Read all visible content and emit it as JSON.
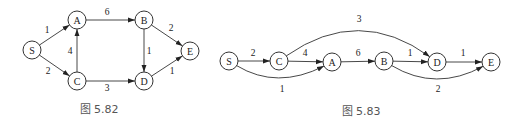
{
  "figures": [
    {
      "id": "fig1",
      "caption": "图 5.82",
      "caption_pos": [
        99,
        109
      ],
      "node_radius": 9,
      "nodes": [
        {
          "id": "S",
          "label": "S",
          "x": 32,
          "y": 50
        },
        {
          "id": "A",
          "label": "A",
          "x": 77,
          "y": 20
        },
        {
          "id": "C",
          "label": "C",
          "x": 77,
          "y": 81
        },
        {
          "id": "B",
          "label": "B",
          "x": 144,
          "y": 20
        },
        {
          "id": "D",
          "label": "D",
          "x": 144,
          "y": 81
        },
        {
          "id": "E",
          "label": "E",
          "x": 190,
          "y": 51
        }
      ],
      "edges": [
        {
          "from": "S",
          "to": "A",
          "weight": "1",
          "label_pos": [
            47,
            30
          ]
        },
        {
          "from": "S",
          "to": "C",
          "weight": "2",
          "label_pos": [
            48,
            71
          ]
        },
        {
          "from": "C",
          "to": "A",
          "weight": "4",
          "label_pos": [
            70,
            51
          ]
        },
        {
          "from": "A",
          "to": "B",
          "weight": "6",
          "label_pos": [
            107,
            12
          ]
        },
        {
          "from": "C",
          "to": "D",
          "weight": "3",
          "label_pos": [
            107,
            88
          ]
        },
        {
          "from": "B",
          "to": "D",
          "weight": "1",
          "label_pos": [
            149,
            51
          ]
        },
        {
          "from": "B",
          "to": "E",
          "weight": "2",
          "label_pos": [
            171,
            28
          ]
        },
        {
          "from": "D",
          "to": "E",
          "weight": "1",
          "label_pos": [
            172,
            71
          ]
        }
      ]
    },
    {
      "id": "fig2",
      "caption": "图 5.83",
      "caption_pos": [
        361,
        111
      ],
      "node_radius": 9,
      "nodes": [
        {
          "id": "S",
          "label": "S",
          "x": 229,
          "y": 61
        },
        {
          "id": "C",
          "label": "C",
          "x": 279,
          "y": 61
        },
        {
          "id": "A",
          "label": "A",
          "x": 332,
          "y": 62
        },
        {
          "id": "B",
          "label": "B",
          "x": 384,
          "y": 61
        },
        {
          "id": "D",
          "label": "D",
          "x": 437,
          "y": 62
        },
        {
          "id": "E",
          "label": "E",
          "x": 491,
          "y": 62
        }
      ],
      "edges": [
        {
          "from": "S",
          "to": "C",
          "weight": "2",
          "label_pos": [
            253,
            53
          ],
          "curve": null
        },
        {
          "from": "C",
          "to": "A",
          "weight": "4",
          "label_pos": [
            305,
            53
          ],
          "curve": null
        },
        {
          "from": "A",
          "to": "B",
          "weight": "6",
          "label_pos": [
            358,
            53
          ],
          "curve": null
        },
        {
          "from": "B",
          "to": "D",
          "weight": "1",
          "label_pos": [
            410,
            53
          ],
          "curve": null
        },
        {
          "from": "D",
          "to": "E",
          "weight": "1",
          "label_pos": [
            463,
            53
          ],
          "curve": null
        },
        {
          "from": "S",
          "to": "A",
          "weight": "1",
          "label_pos": [
            282,
            89
          ],
          "curve": [
            277,
            90
          ]
        },
        {
          "from": "C",
          "to": "D",
          "weight": "3",
          "label_pos": [
            359,
            19
          ],
          "curve": [
            359,
            5
          ]
        },
        {
          "from": "B",
          "to": "E",
          "weight": "2",
          "label_pos": [
            438,
            89
          ],
          "curve": [
            436,
            92
          ]
        }
      ]
    }
  ]
}
